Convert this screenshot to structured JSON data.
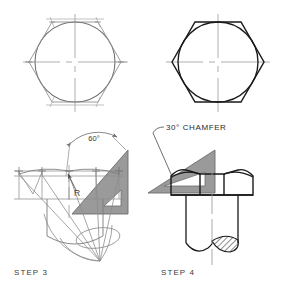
{
  "page": {
    "background": "#ffffff",
    "width": 290,
    "height": 293
  },
  "colors": {
    "construction_line": "#8a8a8a",
    "object_line": "#1a1a1a",
    "center_line": "#9b9b9b",
    "triangle_fill": "#9a9a9a",
    "triangle_edge": "#6d6d6d",
    "text": "#3a3a3a",
    "hatch": "#1a1a1a",
    "background": "#ffffff"
  },
  "panels": {
    "top_left": {
      "name": "hexagon-construction-light",
      "description": "Circle inscribed in hexagon drawn with light construction lines",
      "center": [
        75,
        62
      ],
      "circle_radius": 40,
      "hexagon_circumradius": 46,
      "centerline_h_label": "horizontal-center-line",
      "centerline_v_label": "vertical-center-line"
    },
    "top_right": {
      "name": "hexagon-finished-dark",
      "description": "Same hexagon and circle rendered with finished object lines",
      "center": [
        218,
        62
      ],
      "circle_radius": 40,
      "hexagon_circumradius": 46
    },
    "bottom_left": {
      "name": "step-3-panel",
      "step_label": "STEP 3",
      "angle_label": "60°",
      "radius_label": "R",
      "tool": "60-degree drafting triangle"
    },
    "bottom_right": {
      "name": "step-4-panel",
      "step_label": "STEP 4",
      "chamfer_label": "30° CHAMFER",
      "tool": "30-degree drafting triangle"
    }
  },
  "labels": {
    "step3": "STEP 3",
    "step4": "STEP 4",
    "angle60": "60°",
    "radius": "R",
    "chamfer": "30° CHAMFER"
  }
}
